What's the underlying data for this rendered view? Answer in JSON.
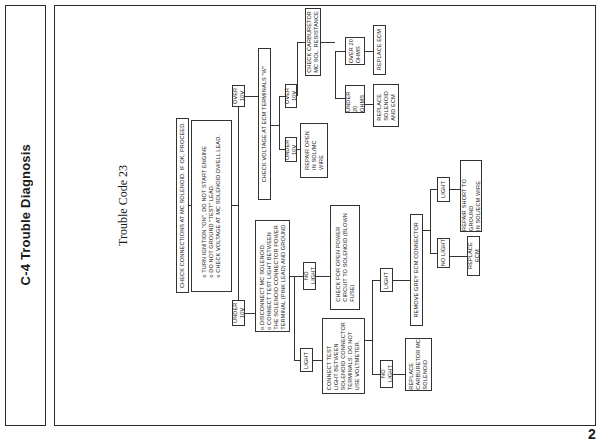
{
  "side_panel": {
    "title": "C-4 Trouble Diagnosis"
  },
  "diagram": {
    "title": "Trouble Code 23",
    "nodes": {
      "check_connections": "CHECK CONNECTIONS AT MC SOLENOID.  IF OK, PROCEED.",
      "instructions_1": "o  TURN IGNITION \"ON\", DO NOT START ENGINE\no  DO NOT GROUND \"TEST\" LEAD.\no  CHECK VOLTAGE AT MC SOLENOID DWELL LEAD.",
      "over_10v_1": "OVER 10V",
      "under_10v_1": "UNDER 10V",
      "check_voltage_ecm": "CHECK VOLTAGE AT ECM TERMINALS \"W\"",
      "under_10v_2": "UNDER 10V",
      "over_10v_2": "OVER 10V",
      "repair_open": "REPAIR OPEN\nIN SOL/MC\nWIRE",
      "check_carb_resistance": "CHECK CARBURETOR\nMC SOL.  RESISTANCE",
      "under_20_ohms": "UNDER 20\nOHMS",
      "over_20_ohms": "OVER 20\nOHMS",
      "replace_sol_ecm": "REPLACE\nSOLENOID\nAND ECM",
      "replace_ecm_1": "REPLACE ECM",
      "instructions_2": "o  DISCONNECT MC SOLENOID.\no  CONNECT TEST LIGHT BETWEEN\n    THE SOLENOID CONNECTOR POWER\n    TERMINAL (PINK LEAD) AND GROUND.",
      "no_light_1": "NO LIGHT",
      "light_1": "LIGHT",
      "check_open_power": "CHECK FOR OPEN POWER\nCIRCUIT TO SOLENOID (BLOWN\nFUSE)",
      "connect_test_light": "CONNECT TEST\nLIGHT BETWEEN\nSOLENOID CONNECTOR\nTERMINALS.  DO NOT\nUSE VOLTMETER.",
      "light_2": "LIGHT",
      "no_light_2": "NO LIGHT",
      "replace_carb_sol": "REPLACE\nCARBURETOR MC\nSOLENOID",
      "remove_grey_ecm": "REMOVE GREY ECM CONNECTOR",
      "no_light_3": "NO LIGHT",
      "light_3": "LIGHT",
      "replace_ecm_2": "REPLACE ECM",
      "repair_short": "REPAIR SHORT TO GROUND\nIN SOL/ECM WIRE"
    }
  },
  "page_number": "2"
}
